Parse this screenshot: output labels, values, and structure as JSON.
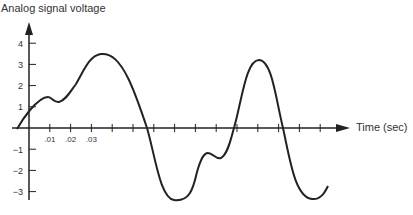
{
  "chart_data": {
    "type": "line",
    "title": "Analog signal voltage",
    "xlabel": "Time (sec)",
    "ylabel": "Analog signal voltage",
    "x_tick_labels": [
      ".01",
      ".02",
      ".03"
    ],
    "y_tick_labels": [
      "4",
      "3",
      "2",
      "1",
      "-1",
      "-2",
      "-3"
    ],
    "y_ticks": [
      4,
      3,
      2,
      1,
      -1,
      -2,
      -3
    ],
    "x_ticks": [
      0.01,
      0.02,
      0.03,
      0.04,
      0.05,
      0.06,
      0.07,
      0.08,
      0.09,
      0.1,
      0.11,
      0.12,
      0.13,
      0.14,
      0.15
    ],
    "ylim": [
      -3.5,
      4.5
    ],
    "xlim": [
      -0.006,
      0.15
    ],
    "grid": false,
    "legend": null,
    "series": [
      {
        "name": "Analog signal",
        "x": [
          -0.006,
          0.0,
          0.009,
          0.014,
          0.02,
          0.035,
          0.057,
          0.07,
          0.086,
          0.095,
          0.1,
          0.102,
          0.12,
          0.133,
          0.144,
          0.158
        ],
        "values": [
          0.0,
          0.75,
          1.3,
          1.1,
          1.5,
          3.4,
          0.0,
          -3.4,
          -1.4,
          -1.5,
          -1.0,
          0.0,
          3.2,
          0.0,
          -3.3,
          -2.7
        ]
      }
    ]
  },
  "axes": {
    "title_text": "Analog signal voltage",
    "x_axis_label": "Time (sec)"
  }
}
